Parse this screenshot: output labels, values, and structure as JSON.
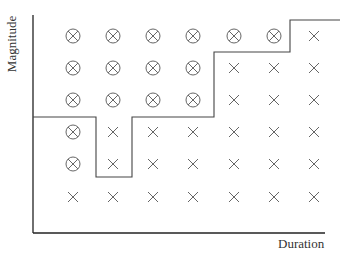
{
  "diagram": {
    "y_axis_label": "Magnitude",
    "x_axis_label": "Duration",
    "columns": 7,
    "rows": 6,
    "legend_symbols": {
      "circled_x": "circled-x-symbol",
      "x": "x-symbol"
    },
    "grid_top_to_bottom": [
      [
        "circled_x",
        "circled_x",
        "circled_x",
        "circled_x",
        "circled_x",
        "circled_x",
        "x"
      ],
      [
        "circled_x",
        "circled_x",
        "circled_x",
        "circled_x",
        "x",
        "x",
        "x"
      ],
      [
        "circled_x",
        "circled_x",
        "circled_x",
        "circled_x",
        "x",
        "x",
        "x"
      ],
      [
        "circled_x",
        "x",
        "x",
        "x",
        "x",
        "x",
        "x"
      ],
      [
        "circled_x",
        "x",
        "x",
        "x",
        "x",
        "x",
        "x"
      ],
      [
        "x",
        "x",
        "x",
        "x",
        "x",
        "x",
        "x"
      ]
    ],
    "boundary_polyline": [
      [
        33,
        117
      ],
      [
        96,
        117
      ],
      [
        96,
        177
      ],
      [
        132,
        177
      ],
      [
        132,
        117
      ],
      [
        214,
        117
      ],
      [
        214,
        52
      ],
      [
        290,
        52
      ],
      [
        290,
        20
      ],
      [
        340,
        20
      ]
    ],
    "line_color": "#333333"
  }
}
